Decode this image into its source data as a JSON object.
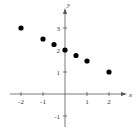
{
  "chart_data": {
    "type": "scatter",
    "title": "",
    "xlabel": "x",
    "ylabel": "y",
    "xlim": [
      -2.4,
      2.9
    ],
    "ylim": [
      -1.6,
      3.6
    ],
    "grid": false,
    "x_ticks": [
      -2,
      -1,
      1,
      2
    ],
    "y_ticks": [
      -1,
      1,
      2,
      3
    ],
    "x_tick_labels": [
      "-2",
      "-1",
      "1",
      "2"
    ],
    "y_tick_labels": [
      "-1",
      "1",
      "2",
      "3"
    ],
    "series": [
      {
        "name": "points",
        "x": [
          -2,
          -1,
          -0.5,
          0,
          0.5,
          1,
          2
        ],
        "y": [
          3,
          2.5,
          2.25,
          2,
          1.75,
          1.5,
          1
        ]
      }
    ],
    "colors": {
      "points": "#000000",
      "axes": "#555555"
    }
  },
  "axes": {
    "x_label": "x",
    "y_label": "y"
  }
}
